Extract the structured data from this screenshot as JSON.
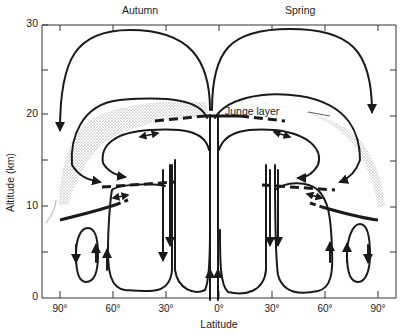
{
  "figure": {
    "season_left": "Autumn",
    "season_right": "Spring",
    "y_axis_label": "Altitude (km)",
    "x_axis_label": "Latitude",
    "y_ticks": [
      "30",
      "20",
      "10",
      "0"
    ],
    "x_ticks": [
      "90°",
      "60°",
      "30°",
      "0°",
      "30°",
      "60°",
      "90°"
    ],
    "annotation": "Junge layer",
    "colors": {
      "line": "#1a1a1a",
      "stipple": "#8a8a8a",
      "background": "#ffffff"
    }
  }
}
